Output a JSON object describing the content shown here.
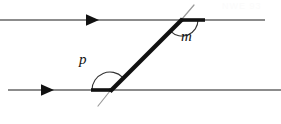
{
  "figure": {
    "kind": "geometry-diagram",
    "width": 281,
    "height": 124,
    "background_color": "#ffffff"
  },
  "colors": {
    "parallel_line": "#8c8c8c",
    "transversal": "#111111",
    "transversal_tail": "#9a9a9a",
    "arc": "#333333",
    "arrowhead": "#111111",
    "label": "#111111",
    "watermark": "#fbfbfb"
  },
  "parallel_lines": [
    {
      "name": "top-parallel-line",
      "x1": 0,
      "y1": 20,
      "x2": 265,
      "y2": 20,
      "stroke_width": 1.6,
      "arrow": {
        "name": "top-arrowhead",
        "x": 95,
        "y": 20,
        "direction": "right",
        "size": 9
      }
    },
    {
      "name": "bottom-parallel-line",
      "x1": 8,
      "y1": 90,
      "x2": 281,
      "y2": 90,
      "stroke_width": 1.6,
      "arrow": {
        "name": "bottom-arrowhead",
        "x": 50,
        "y": 90,
        "direction": "right",
        "size": 9
      }
    }
  ],
  "transversal": {
    "name": "transversal-line",
    "main_segment": {
      "x1": 110,
      "y1": 91,
      "x2": 182,
      "y2": 19,
      "stroke_width": 4.2
    },
    "upper_tail": {
      "x1": 182,
      "y1": 19,
      "x2": 193,
      "y2": 6,
      "stroke_width": 1.1
    },
    "lower_tail": {
      "x1": 110,
      "y1": 91,
      "x2": 99,
      "y2": 105,
      "stroke_width": 1.1
    }
  },
  "highlight_rays": [
    {
      "name": "top-highlight-ray",
      "description": "thick black ray along top line to the right of the intersection",
      "x1": 182,
      "y1": 20,
      "x2": 205,
      "y2": 20,
      "stroke_width": 3.6
    },
    {
      "name": "bottom-highlight-ray",
      "description": "thick black ray along bottom line to the left of the intersection",
      "x1": 110,
      "y1": 90,
      "x2": 91,
      "y2": 90,
      "stroke_width": 3.6
    }
  ],
  "intersections": [
    {
      "name": "top-intersection-point",
      "x": 182,
      "y": 20
    },
    {
      "name": "bottom-intersection-point",
      "x": 110,
      "y": 90
    }
  ],
  "angles": [
    {
      "name": "angle-m",
      "label": "m",
      "vertex": {
        "x": 182,
        "y": 20
      },
      "label_position": {
        "x": 181,
        "y": 29
      },
      "arc": {
        "radius": 16,
        "start_deg": 0,
        "end_deg": 135,
        "path": "M 198 20 A 16 16 0 0 1 170.7 31.3"
      },
      "measure_description": "angle between the rightward ray on the top parallel line and the transversal going down-left"
    },
    {
      "name": "angle-p",
      "label": "p",
      "vertex": {
        "x": 110,
        "y": 90
      },
      "label_position": {
        "x": 79,
        "y": 52
      },
      "arc": {
        "radius": 18,
        "start_deg": 180,
        "end_deg": 45,
        "path": "M 92 90 A 18 18 0 0 1 122.7 77.3"
      },
      "measure_description": "angle between the leftward ray on the bottom parallel line and the transversal going up-right"
    }
  ],
  "watermark": {
    "name": "corner-watermark",
    "text": "NWE 93"
  }
}
